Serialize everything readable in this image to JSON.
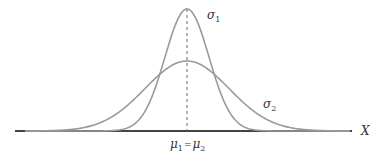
{
  "diagram": {
    "type": "normal-distribution-comparison",
    "axis_label": "X",
    "mean_label": "μ₁ = μ₂",
    "mean_label_parts": {
      "mu1": "μ",
      "sub1": "1",
      "eq": "=",
      "mu2": "μ",
      "sub2": "2"
    },
    "curves": [
      {
        "name": "σ1",
        "label": "σ",
        "subscript": "1",
        "peak_y": 9,
        "width_sd": 22
      },
      {
        "name": "σ2",
        "label": "σ",
        "subscript": "2",
        "peak_y": 61,
        "width_sd": 42
      }
    ],
    "colors": {
      "curve": "#9a9a9a",
      "axis": "#444444",
      "dash": "#666666",
      "text": "#333333"
    },
    "geometry": {
      "center_x": 187,
      "baseline_y": 131,
      "axis_start_x": 15,
      "axis_end_x": 352
    }
  }
}
